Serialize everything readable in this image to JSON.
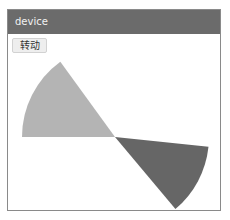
{
  "window": {
    "title": "device"
  },
  "toolbar": {
    "rotate_label": "转动"
  },
  "canvas": {
    "center": [
      107,
      127
    ],
    "sectors": [
      {
        "name": "light-sector",
        "color": "#b4b4b4",
        "radius": 93,
        "start_deg": 126,
        "end_deg": 180
      },
      {
        "name": "dark-sector",
        "color": "#666666",
        "radius": 94,
        "start_deg": -50,
        "end_deg": -6
      }
    ]
  }
}
